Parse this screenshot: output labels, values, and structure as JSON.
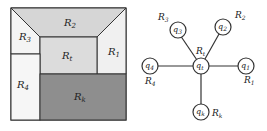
{
  "left_diagram": {
    "regions": [
      {
        "id": "R2",
        "label": "R",
        "sub": "2"
      },
      {
        "id": "R3",
        "label": "R",
        "sub": "3"
      },
      {
        "id": "Rt",
        "label": "R",
        "sub": "t"
      },
      {
        "id": "R1",
        "label": "R",
        "sub": "1"
      },
      {
        "id": "R4",
        "label": "R",
        "sub": "4"
      },
      {
        "id": "Rk",
        "label": "R",
        "sub": "k"
      }
    ]
  },
  "right_diagram": {
    "center": {
      "node": "q",
      "node_sub": "t",
      "region": "R",
      "region_sub": "t"
    },
    "nodes": [
      {
        "node": "q",
        "node_sub": "3",
        "region": "R",
        "region_sub": "3"
      },
      {
        "node": "q",
        "node_sub": "2",
        "region": "R",
        "region_sub": "2"
      },
      {
        "node": "q",
        "node_sub": "4",
        "region": "R",
        "region_sub": "4"
      },
      {
        "node": "q",
        "node_sub": "1",
        "region": "R",
        "region_sub": "1"
      },
      {
        "node": "q",
        "node_sub": "k",
        "region": "R",
        "region_sub": "k"
      }
    ]
  },
  "colors": {
    "outline": "#333333",
    "r2_fill": "#d9d9d9",
    "rt_fill": "#dcdcdc",
    "rk_fill": "#8c8c8c",
    "light_fill": "#f2f2f2"
  }
}
